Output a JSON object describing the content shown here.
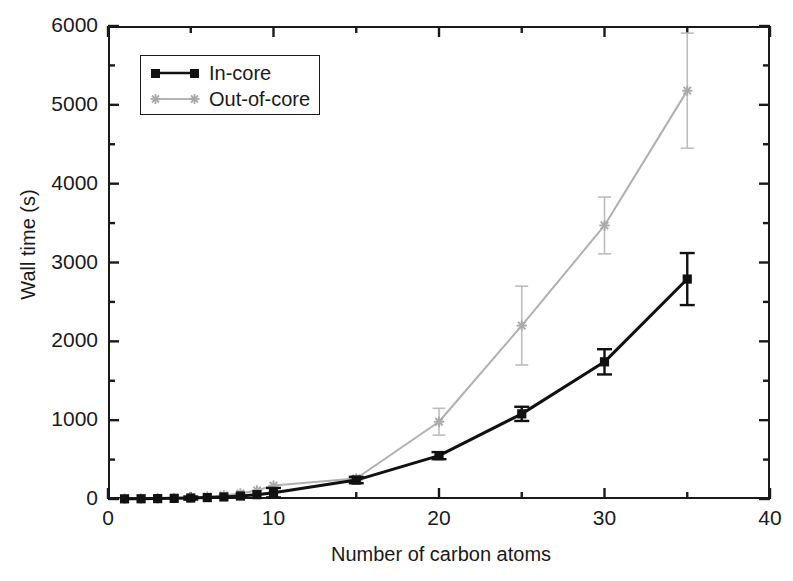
{
  "chart_data": {
    "type": "line",
    "title": "",
    "xlabel": "Number of carbon atoms",
    "ylabel": "Wall time (s)",
    "xlim": [
      0,
      40
    ],
    "ylim": [
      0,
      6000
    ],
    "xticks": [
      0,
      10,
      20,
      30,
      40
    ],
    "xtick_labels": [
      "0",
      "10",
      "20",
      "30",
      "40"
    ],
    "xminor_ticks": [
      5,
      15,
      25,
      35
    ],
    "yticks": [
      0,
      1000,
      2000,
      3000,
      4000,
      5000,
      6000
    ],
    "ytick_labels": [
      "0",
      "1000",
      "2000",
      "3000",
      "4000",
      "5000",
      "6000"
    ],
    "yminor_ticks": [
      500,
      1500,
      2500,
      3500,
      4500,
      5500
    ],
    "grid": false,
    "legend_position": "upper left",
    "series": [
      {
        "name": "In-core",
        "marker": "square",
        "color": "#111111",
        "x": [
          1,
          2,
          3,
          4,
          5,
          6,
          7,
          8,
          9,
          10,
          15,
          20,
          25,
          30,
          35
        ],
        "values": [
          2,
          3,
          5,
          8,
          12,
          18,
          26,
          38,
          55,
          80,
          240,
          550,
          1080,
          1740,
          2790
        ],
        "yerr": [
          0,
          0,
          0,
          0,
          20,
          0,
          0,
          0,
          0,
          60,
          40,
          45,
          90,
          160,
          330
        ]
      },
      {
        "name": "Out-of-core",
        "marker": "asterisk",
        "color": "#aaaaaa",
        "x": [
          1,
          2,
          3,
          4,
          5,
          6,
          7,
          8,
          9,
          10,
          15,
          20,
          25,
          30,
          35
        ],
        "values": [
          3,
          5,
          8,
          13,
          20,
          30,
          45,
          70,
          110,
          170,
          260,
          980,
          2200,
          3470,
          5180
        ],
        "yerr": [
          0,
          0,
          0,
          0,
          0,
          0,
          0,
          0,
          0,
          0,
          30,
          170,
          500,
          360,
          730
        ]
      }
    ]
  },
  "legend": {
    "items": [
      {
        "label": "In-core"
      },
      {
        "label": "Out-of-core"
      }
    ]
  }
}
